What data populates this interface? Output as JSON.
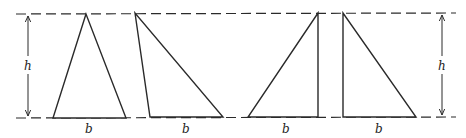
{
  "diagram": {
    "labels": {
      "height": "h",
      "base": "b"
    },
    "stroke_color": "#2a2a2a",
    "background": "#ffffff",
    "triangles": [
      {
        "name": "acute-isosceles",
        "points": "86,14 53,118 126,118",
        "base_label_x": 89
      },
      {
        "name": "obtuse-leaning",
        "points": "135,13 150,117 223,117",
        "base_label_x": 184
      },
      {
        "name": "right-angle-right",
        "points": "318,13 248,117 318,117",
        "base_label_x": 286
      },
      {
        "name": "right-angle-left",
        "points": "343,13 343,117 416,117",
        "base_label_x": 378
      }
    ]
  }
}
